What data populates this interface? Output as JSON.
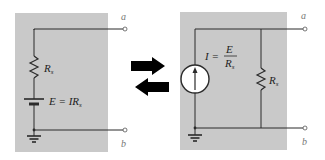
{
  "colors": {
    "panel": "#c9c9c9",
    "wire": "#2a2a2a",
    "arrow": "#000000",
    "terminal_label": "#777777"
  },
  "left_circuit": {
    "type": "voltage-source-with-series-resistance",
    "resistor_label": "R",
    "resistor_sub": "s",
    "source_label": "E = IR",
    "source_sub": "s",
    "terminal_top": "a",
    "terminal_bottom": "b"
  },
  "right_circuit": {
    "type": "current-source-with-parallel-resistance",
    "current_label": "I =",
    "fraction_numerator": "E",
    "fraction_denominator": "R",
    "fraction_denominator_sub": "s",
    "resistor_label": "R",
    "resistor_sub": "s",
    "terminal_top": "a",
    "terminal_bottom": "b"
  },
  "conversion_arrows": {
    "right_arrow": "→",
    "left_arrow": "←"
  }
}
